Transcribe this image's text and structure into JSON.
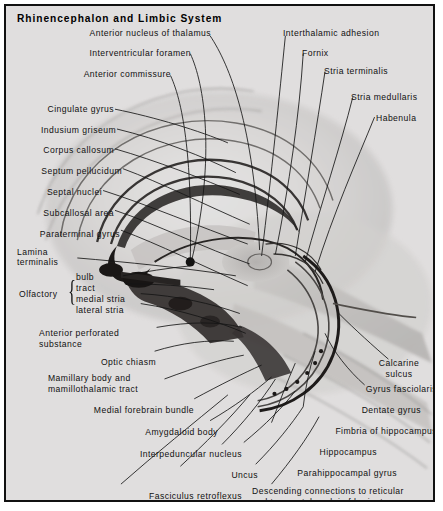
{
  "plate": {
    "title": "Rhinencephalon and Limbic System",
    "background_color": "#eceaea",
    "border_color": "#111111",
    "leader_color": "#141414"
  },
  "labels_left": [
    {
      "key": "cingulate_gyrus",
      "text": "Cingulate gyrus"
    },
    {
      "key": "indusium_griseum",
      "text": "Indusium griseum"
    },
    {
      "key": "corpus_callosum",
      "text": "Corpus callosum"
    },
    {
      "key": "septum_pellucidum",
      "text": "Septum pellucidum"
    },
    {
      "key": "septal_nuclei",
      "text": "Septal nuclei"
    },
    {
      "key": "subcallosal_area",
      "text": "Subcallosal area"
    },
    {
      "key": "paraterminal_gyrus",
      "text": "Paraterminal gyrus"
    }
  ],
  "labels_top": [
    {
      "key": "anterior_nucleus_of_thalamus",
      "text": "Anterior nucleus of thalamus"
    },
    {
      "key": "interventricular_foramen",
      "text": "Interventricular foramen"
    },
    {
      "key": "anterior_commissure",
      "text": "Anterior commissure"
    },
    {
      "key": "interthalamic_adhesion",
      "text": "Interthalamic adhesion"
    },
    {
      "key": "fornix",
      "text": "Fornix"
    },
    {
      "key": "stria_terminalis",
      "text": "Stria terminalis"
    },
    {
      "key": "stria_medullaris",
      "text": "Stria medullaris"
    },
    {
      "key": "habenula",
      "text": "Habenula"
    }
  ],
  "lamina_terminalis": {
    "line1": "Lamina",
    "line2": "terminalis"
  },
  "olfactory_group": {
    "label": "Olfactory",
    "items": [
      {
        "key": "bulb",
        "text": "bulb"
      },
      {
        "key": "tract",
        "text": "tract"
      },
      {
        "key": "medial_stria",
        "text": "medial stria"
      },
      {
        "key": "lateral_stria",
        "text": "lateral stria"
      }
    ]
  },
  "labels_lower_left": [
    {
      "key": "anterior_perforated_substance",
      "line1": "Anterior perforated",
      "line2": "substance"
    },
    {
      "key": "optic_chiasm",
      "line1": "Optic chiasm",
      "line2": ""
    },
    {
      "key": "mamillary_body",
      "line1": "Mamillary body and",
      "line2": "mamillothalamic tract"
    },
    {
      "key": "medial_forebrain_bundle",
      "line1": "Medial forebrain bundle",
      "line2": ""
    },
    {
      "key": "amygdaloid_body",
      "line1": "Amygdaloid body",
      "line2": ""
    },
    {
      "key": "interpeduncular_nucleus",
      "line1": "Interpeduncular nucleus",
      "line2": ""
    },
    {
      "key": "uncus",
      "line1": "Uncus",
      "line2": ""
    },
    {
      "key": "fasciculus_retroflexus",
      "line1": "Fasciculus retroflexus",
      "line2": ""
    }
  ],
  "labels_right": [
    {
      "key": "calcarine_sulcus",
      "line1": "Calcarine",
      "line2": "sulcus"
    },
    {
      "key": "gyrus_fasciolaris",
      "line1": "Gyrus fasciolaris",
      "line2": ""
    },
    {
      "key": "dentate_gyrus",
      "line1": "Dentate gyrus",
      "line2": ""
    },
    {
      "key": "fimbria_of_hippocampus",
      "line1": "Fimbria of hippocampus",
      "line2": ""
    },
    {
      "key": "hippocampus",
      "line1": "Hippocampus",
      "line2": ""
    },
    {
      "key": "parahippocampal_gyrus",
      "line1": "Parahippocampal gyrus",
      "line2": ""
    }
  ],
  "descending_connections": {
    "line1": "Descending connections to reticular",
    "line2": "and tegmental nuclei of brainstem"
  }
}
